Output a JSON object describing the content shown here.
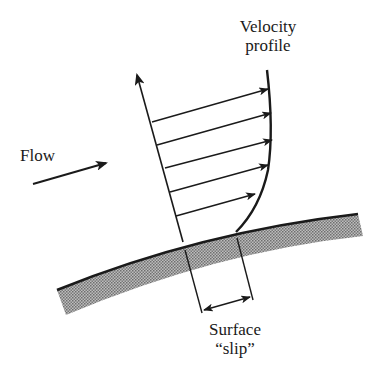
{
  "diagram": {
    "labels": {
      "velocity_profile": [
        "Velocity",
        "profile"
      ],
      "flow": "Flow",
      "surface_slip": [
        "Surface",
        "“slip”"
      ]
    },
    "colors": {
      "ink": "#1a1a1a",
      "surface_fill": "#9a9a9a",
      "background": "#ffffff"
    },
    "elements": {
      "normal_axis": {
        "from": [
          183,
          242
        ],
        "to": [
          136,
          72
        ],
        "arrowhead": true
      },
      "velocity_profile_curve": {
        "top": [
          267,
          70
        ],
        "bottom": [
          236,
          232
        ]
      },
      "velocity_arrows": [
        {
          "from": [
            152,
            122
          ],
          "to": [
            268,
            89
          ]
        },
        {
          "from": [
            157,
            145
          ],
          "to": [
            270,
            113
          ]
        },
        {
          "from": [
            165,
            168
          ],
          "to": [
            272,
            140
          ]
        },
        {
          "from": [
            175,
            190
          ],
          "to": [
            268,
            165
          ]
        },
        {
          "from": [
            176,
            216
          ],
          "to": [
            255,
            194
          ]
        }
      ],
      "flow_arrow": {
        "from": [
          33,
          184
        ],
        "to": [
          106,
          163
        ]
      },
      "surface": {
        "left": [
          57,
          290
        ],
        "right": [
          358,
          214
        ]
      },
      "slip_extension_lines": [
        {
          "from": [
            185,
            250
          ],
          "to": [
            202,
            313
          ]
        },
        {
          "from": [
            237,
            238
          ],
          "to": [
            253,
            300
          ]
        }
      ],
      "slip_dimension_arrow": {
        "from": [
          204,
          310
        ],
        "to": [
          250,
          297
        ],
        "double_headed": true
      }
    }
  }
}
